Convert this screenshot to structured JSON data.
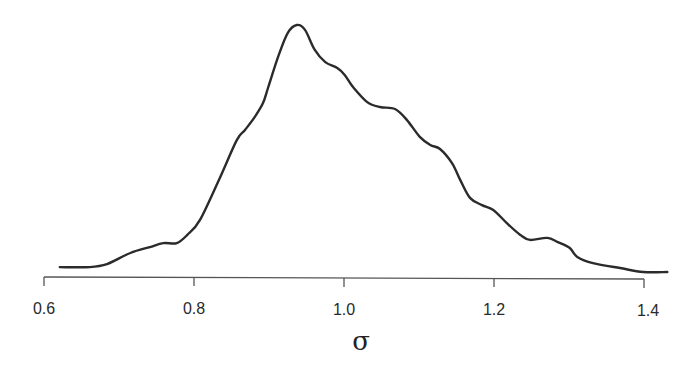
{
  "chart_data": {
    "type": "line",
    "subtype": "density",
    "title": "",
    "xlabel": "σ",
    "ylabel": "",
    "xlim": [
      0.6,
      1.43
    ],
    "ylim": [
      0,
      1.0
    ],
    "grid": false,
    "legend": null,
    "y_axis_shown": false,
    "x_ticks": [
      0.6,
      0.8,
      1.0,
      1.2,
      1.4
    ],
    "x_tick_labels": [
      "0.6",
      "0.8",
      "1.0",
      "1.2",
      "1.4"
    ],
    "series": [
      {
        "name": "density of σ (relative to peak)",
        "color": "#2b2b2b",
        "x": [
          0.621,
          0.661,
          0.684,
          0.715,
          0.741,
          0.759,
          0.777,
          0.791,
          0.808,
          0.835,
          0.857,
          0.868,
          0.881,
          0.892,
          0.899,
          0.912,
          0.925,
          0.937,
          0.948,
          0.961,
          0.975,
          0.991,
          1.001,
          1.012,
          1.031,
          1.048,
          1.068,
          1.084,
          1.101,
          1.115,
          1.128,
          1.144,
          1.155,
          1.168,
          1.184,
          1.199,
          1.217,
          1.235,
          1.248,
          1.271,
          1.285,
          1.301,
          1.311,
          1.332,
          1.368,
          1.399,
          1.431
        ],
        "y": [
          0.02,
          0.02,
          0.032,
          0.077,
          0.101,
          0.117,
          0.117,
          0.15,
          0.211,
          0.385,
          0.534,
          0.575,
          0.628,
          0.684,
          0.749,
          0.87,
          0.968,
          1.0,
          0.98,
          0.899,
          0.85,
          0.826,
          0.798,
          0.749,
          0.688,
          0.668,
          0.66,
          0.615,
          0.547,
          0.514,
          0.498,
          0.441,
          0.372,
          0.3,
          0.271,
          0.251,
          0.198,
          0.15,
          0.13,
          0.138,
          0.121,
          0.097,
          0.061,
          0.036,
          0.016,
          0.0,
          0.0
        ]
      }
    ],
    "peak": {
      "x": 0.937,
      "y": 1.0
    }
  },
  "axis": {
    "x_title": "σ",
    "ticks": [
      {
        "value": 0.6,
        "label": "0.6"
      },
      {
        "value": 0.8,
        "label": "0.8"
      },
      {
        "value": 1.0,
        "label": "1.0"
      },
      {
        "value": 1.2,
        "label": "1.2"
      },
      {
        "value": 1.4,
        "label": "1.4"
      }
    ]
  }
}
